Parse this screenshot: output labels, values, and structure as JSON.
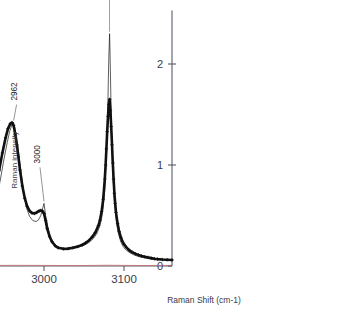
{
  "chart_data": {
    "type": "line",
    "title": "",
    "xlabel": "Raman Shift (cm-1)",
    "ylabel": "Raman intensity",
    "xlim": [
      3160,
      2845
    ],
    "ylim": [
      0,
      2.45
    ],
    "x_ticks": [
      3100,
      3000,
      2900
    ],
    "x_tick_labels": [
      "3100",
      "3000",
      "2900"
    ],
    "y_ticks": [
      0,
      1,
      2
    ],
    "y_tick_labels": [
      "0",
      "1",
      "2"
    ],
    "grid": false,
    "legend": "none",
    "x_axis_direction": "decreasing",
    "annotations": [
      {
        "label": "3082",
        "x": 3082,
        "y": 2.3,
        "color": "#c0392b",
        "rotation": -90
      },
      {
        "label": "3000",
        "x": 3000,
        "y": 0.62,
        "color": "#1a1a1a",
        "rotation": -90
      },
      {
        "label": "2945",
        "x": 2945,
        "y": 1.42,
        "color": "#1a1a1a",
        "rotation": -90
      },
      {
        "label": "2962",
        "x": 2962,
        "y": 1.42,
        "color": "#1a1a1a",
        "rotation": -90
      },
      {
        "label": "2909",
        "x": 2909,
        "y": 0.32,
        "color": "#1a1a1a",
        "rotation": -90
      },
      {
        "label": "2894",
        "x": 2894,
        "y": 0.33,
        "color": "#1a1a1a",
        "rotation": -90
      }
    ],
    "series": [
      {
        "name": "fit",
        "style": "thin-line",
        "color": "#1a1a1a",
        "points": [
          [
            3160,
            0.055
          ],
          [
            3150,
            0.06
          ],
          [
            3140,
            0.065
          ],
          [
            3132,
            0.072
          ],
          [
            3126,
            0.08
          ],
          [
            3120,
            0.09
          ],
          [
            3116,
            0.1
          ],
          [
            3112,
            0.112
          ],
          [
            3108,
            0.128
          ],
          [
            3104,
            0.15
          ],
          [
            3100,
            0.18
          ],
          [
            3098,
            0.205
          ],
          [
            3096,
            0.24
          ],
          [
            3094,
            0.29
          ],
          [
            3092,
            0.36
          ],
          [
            3090,
            0.47
          ],
          [
            3088,
            0.64
          ],
          [
            3086,
            0.92
          ],
          [
            3085,
            1.15
          ],
          [
            3084,
            1.48
          ],
          [
            3083,
            1.93
          ],
          [
            3082,
            2.3
          ],
          [
            3081,
            2.06
          ],
          [
            3080,
            1.68
          ],
          [
            3079,
            1.34
          ],
          [
            3078,
            1.08
          ],
          [
            3076,
            0.76
          ],
          [
            3074,
            0.58
          ],
          [
            3072,
            0.47
          ],
          [
            3070,
            0.4
          ],
          [
            3066,
            0.32
          ],
          [
            3062,
            0.275
          ],
          [
            3058,
            0.245
          ],
          [
            3054,
            0.222
          ],
          [
            3050,
            0.205
          ],
          [
            3044,
            0.188
          ],
          [
            3038,
            0.176
          ],
          [
            3032,
            0.17
          ],
          [
            3026,
            0.168
          ],
          [
            3020,
            0.175
          ],
          [
            3016,
            0.192
          ],
          [
            3012,
            0.225
          ],
          [
            3008,
            0.29
          ],
          [
            3005,
            0.38
          ],
          [
            3002,
            0.5
          ],
          [
            3000,
            0.62
          ],
          [
            2998,
            0.56
          ],
          [
            2996,
            0.5
          ],
          [
            2993,
            0.455
          ],
          [
            2990,
            0.44
          ],
          [
            2986,
            0.45
          ],
          [
            2982,
            0.49
          ],
          [
            2978,
            0.58
          ],
          [
            2974,
            0.76
          ],
          [
            2970,
            1.01
          ],
          [
            2967,
            1.21
          ],
          [
            2964,
            1.35
          ],
          [
            2962,
            1.42
          ],
          [
            2960,
            1.4
          ],
          [
            2957,
            1.33
          ],
          [
            2954,
            1.22
          ],
          [
            2950,
            1.06
          ],
          [
            2946,
            0.88
          ],
          [
            2942,
            0.71
          ],
          [
            2938,
            0.57
          ],
          [
            2934,
            0.46
          ],
          [
            2930,
            0.378
          ],
          [
            2926,
            0.318
          ],
          [
            2922,
            0.278
          ],
          [
            2918,
            0.252
          ],
          [
            2914,
            0.238
          ],
          [
            2912,
            0.25
          ],
          [
            2910,
            0.3
          ],
          [
            2909,
            0.33
          ],
          [
            2908,
            0.3
          ],
          [
            2906,
            0.255
          ],
          [
            2903,
            0.24
          ],
          [
            2900,
            0.25
          ],
          [
            2897,
            0.29
          ],
          [
            2894,
            0.33
          ],
          [
            2891,
            0.32
          ],
          [
            2888,
            0.3
          ],
          [
            2884,
            0.268
          ],
          [
            2880,
            0.23
          ],
          [
            2876,
            0.192
          ],
          [
            2872,
            0.158
          ],
          [
            2868,
            0.13
          ],
          [
            2864,
            0.108
          ],
          [
            2860,
            0.092
          ],
          [
            2856,
            0.08
          ],
          [
            2852,
            0.072
          ],
          [
            2848,
            0.066
          ],
          [
            2845,
            0.062
          ]
        ]
      },
      {
        "name": "experimental",
        "style": "thick-marker-line",
        "color": "#111111",
        "points": [
          [
            3160,
            0.06
          ],
          [
            3154,
            0.062
          ],
          [
            3148,
            0.064
          ],
          [
            3142,
            0.068
          ],
          [
            3138,
            0.072
          ],
          [
            3134,
            0.078
          ],
          [
            3130,
            0.085
          ],
          [
            3126,
            0.092
          ],
          [
            3122,
            0.1
          ],
          [
            3118,
            0.11
          ],
          [
            3114,
            0.122
          ],
          [
            3110,
            0.138
          ],
          [
            3106,
            0.16
          ],
          [
            3103,
            0.185
          ],
          [
            3100,
            0.215
          ],
          [
            3098,
            0.245
          ],
          [
            3096,
            0.285
          ],
          [
            3094,
            0.34
          ],
          [
            3092,
            0.42
          ],
          [
            3090,
            0.53
          ],
          [
            3089,
            0.62
          ],
          [
            3088,
            0.72
          ],
          [
            3087,
            0.86
          ],
          [
            3086,
            1.02
          ],
          [
            3085,
            1.2
          ],
          [
            3084,
            1.38
          ],
          [
            3083,
            1.54
          ],
          [
            3082,
            1.65
          ],
          [
            3081,
            1.6
          ],
          [
            3080,
            1.48
          ],
          [
            3079,
            1.33
          ],
          [
            3078,
            1.16
          ],
          [
            3077,
            1.0
          ],
          [
            3076,
            0.86
          ],
          [
            3074,
            0.66
          ],
          [
            3072,
            0.54
          ],
          [
            3070,
            0.455
          ],
          [
            3068,
            0.4
          ],
          [
            3064,
            0.33
          ],
          [
            3060,
            0.285
          ],
          [
            3056,
            0.252
          ],
          [
            3052,
            0.228
          ],
          [
            3048,
            0.21
          ],
          [
            3042,
            0.192
          ],
          [
            3036,
            0.18
          ],
          [
            3030,
            0.172
          ],
          [
            3024,
            0.17
          ],
          [
            3018,
            0.18
          ],
          [
            3014,
            0.2
          ],
          [
            3010,
            0.24
          ],
          [
            3007,
            0.29
          ],
          [
            3004,
            0.37
          ],
          [
            3002,
            0.45
          ],
          [
            3000,
            0.52
          ],
          [
            2998,
            0.545
          ],
          [
            2996,
            0.55
          ],
          [
            2994,
            0.545
          ],
          [
            2991,
            0.53
          ],
          [
            2988,
            0.52
          ],
          [
            2985,
            0.525
          ],
          [
            2982,
            0.545
          ],
          [
            2979,
            0.59
          ],
          [
            2976,
            0.67
          ],
          [
            2973,
            0.79
          ],
          [
            2970,
            0.95
          ],
          [
            2968,
            1.08
          ],
          [
            2966,
            1.2
          ],
          [
            2964,
            1.31
          ],
          [
            2962,
            1.39
          ],
          [
            2960,
            1.42
          ],
          [
            2958,
            1.41
          ],
          [
            2955,
            1.36
          ],
          [
            2952,
            1.27
          ],
          [
            2948,
            1.12
          ],
          [
            2944,
            0.95
          ],
          [
            2940,
            0.78
          ],
          [
            2936,
            0.63
          ],
          [
            2932,
            0.51
          ],
          [
            2928,
            0.415
          ],
          [
            2924,
            0.345
          ],
          [
            2920,
            0.298
          ],
          [
            2916,
            0.268
          ],
          [
            2912,
            0.252
          ],
          [
            2908,
            0.248
          ],
          [
            2904,
            0.255
          ],
          [
            2900,
            0.272
          ],
          [
            2897,
            0.295
          ],
          [
            2894,
            0.315
          ],
          [
            2891,
            0.325
          ],
          [
            2888,
            0.322
          ],
          [
            2885,
            0.31
          ],
          [
            2882,
            0.288
          ],
          [
            2878,
            0.252
          ],
          [
            2874,
            0.212
          ],
          [
            2870,
            0.176
          ],
          [
            2866,
            0.146
          ],
          [
            2862,
            0.122
          ],
          [
            2858,
            0.104
          ],
          [
            2854,
            0.09
          ],
          [
            2850,
            0.08
          ],
          [
            2847,
            0.074
          ],
          [
            2845,
            0.07
          ]
        ]
      },
      {
        "name": "residual",
        "style": "baseline-thin",
        "color": "#cc5555",
        "points": [
          [
            3160,
            0.006
          ],
          [
            3120,
            0.005
          ],
          [
            3080,
            0.008
          ],
          [
            3040,
            0.004
          ],
          [
            3000,
            0.006
          ],
          [
            2960,
            0.007
          ],
          [
            2920,
            0.004
          ],
          [
            2880,
            0.005
          ],
          [
            2845,
            0.006
          ]
        ]
      }
    ]
  }
}
